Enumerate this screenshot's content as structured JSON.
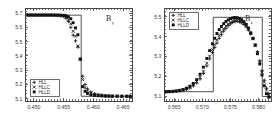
{
  "figure": {
    "background": "#ffffff",
    "frame_color": "#4a4a4a",
    "marker_color": "#111111",
    "panel_count": 2
  },
  "chart_data": [
    {
      "type": "scatter",
      "panel_id": "left",
      "title": "",
      "annotation": "B",
      "annotation_sub": "y",
      "xlabel": "",
      "ylabel": "",
      "xlim": [
        0.4485,
        0.4665
      ],
      "ylim": [
        5.085,
        5.735
      ],
      "xticks": [
        0.45,
        0.455,
        0.46,
        0.465
      ],
      "xtick_labels": [
        "0.450",
        "0.455",
        "0.460",
        "0.465"
      ],
      "yticks": [
        5.1,
        5.2,
        5.3,
        5.4,
        5.5,
        5.6,
        5.7
      ],
      "ytick_labels": [
        "5.1",
        "5.2",
        "5.3",
        "5.4",
        "5.5",
        "5.6",
        "5.7"
      ],
      "grid": false,
      "legend_position": "lower-left",
      "reference_step": {
        "name": "exact",
        "x": [
          0.4485,
          0.45795,
          0.45795,
          0.4665
        ],
        "y": [
          5.685,
          5.685,
          5.118,
          5.118
        ]
      },
      "series": [
        {
          "name": "HLL",
          "marker": "plus",
          "x": [
            0.449,
            0.4495,
            0.45,
            0.4505,
            0.451,
            0.4515,
            0.452,
            0.4525,
            0.453,
            0.4535,
            0.454,
            0.4545,
            0.455,
            0.4554,
            0.4558,
            0.4562,
            0.4566,
            0.457,
            0.4574,
            0.4578,
            0.4582,
            0.4586,
            0.459,
            0.4596,
            0.4602,
            0.4608,
            0.4614,
            0.462,
            0.4626,
            0.4632,
            0.464,
            0.4648,
            0.4656,
            0.4662
          ],
          "y": [
            5.684,
            5.684,
            5.684,
            5.684,
            5.684,
            5.684,
            5.684,
            5.684,
            5.684,
            5.683,
            5.682,
            5.681,
            5.676,
            5.664,
            5.64,
            5.6,
            5.545,
            5.505,
            5.462,
            5.376,
            5.258,
            5.2,
            5.17,
            5.148,
            5.136,
            5.13,
            5.126,
            5.123,
            5.121,
            5.12,
            5.119,
            5.118,
            5.118,
            5.118
          ]
        },
        {
          "name": "HLLC",
          "marker": "cross",
          "x": [
            0.449,
            0.4495,
            0.45,
            0.4505,
            0.451,
            0.4515,
            0.452,
            0.4525,
            0.453,
            0.4535,
            0.454,
            0.4545,
            0.455,
            0.4554,
            0.4558,
            0.4562,
            0.4566,
            0.457,
            0.4574,
            0.4578,
            0.4582,
            0.4586,
            0.459,
            0.4596,
            0.4602,
            0.4608,
            0.4614,
            0.462,
            0.4626,
            0.4632,
            0.464,
            0.4648,
            0.4656,
            0.4662
          ],
          "y": [
            5.685,
            5.685,
            5.685,
            5.685,
            5.685,
            5.685,
            5.685,
            5.685,
            5.685,
            5.684,
            5.684,
            5.683,
            5.68,
            5.672,
            5.656,
            5.625,
            5.572,
            5.538,
            5.47,
            5.378,
            5.235,
            5.178,
            5.155,
            5.14,
            5.131,
            5.127,
            5.124,
            5.122,
            5.12,
            5.119,
            5.119,
            5.118,
            5.118,
            5.118
          ]
        },
        {
          "name": "HLLD",
          "marker": "square",
          "x": [
            0.449,
            0.4495,
            0.45,
            0.4505,
            0.451,
            0.4515,
            0.452,
            0.4525,
            0.453,
            0.4535,
            0.454,
            0.4545,
            0.455,
            0.4554,
            0.4558,
            0.4562,
            0.4566,
            0.457,
            0.4574,
            0.4578,
            0.4582,
            0.4586,
            0.459,
            0.4596,
            0.4602,
            0.4608,
            0.4614,
            0.462,
            0.4626,
            0.4632,
            0.464,
            0.4648,
            0.4656,
            0.4662
          ],
          "y": [
            5.686,
            5.686,
            5.686,
            5.686,
            5.686,
            5.686,
            5.686,
            5.686,
            5.686,
            5.686,
            5.686,
            5.685,
            5.684,
            5.681,
            5.674,
            5.66,
            5.632,
            5.596,
            5.548,
            5.378,
            5.186,
            5.152,
            5.138,
            5.128,
            5.124,
            5.122,
            5.12,
            5.119,
            5.119,
            5.118,
            5.118,
            5.118,
            5.118,
            5.118
          ]
        }
      ]
    },
    {
      "type": "scatter",
      "panel_id": "right",
      "title": "",
      "annotation": "B",
      "annotation_sub": "z",
      "xlabel": "",
      "ylabel": "",
      "xlim": [
        0.5632,
        0.5822
      ],
      "ylim": [
        5.075,
        5.545
      ],
      "xticks": [
        0.565,
        0.57,
        0.575,
        0.58
      ],
      "xtick_labels": [
        "0.565",
        "0.570",
        "0.575",
        "0.580"
      ],
      "yticks": [
        5.1,
        5.2,
        5.3,
        5.4,
        5.5
      ],
      "ytick_labels": [
        "5.1",
        "5.2",
        "5.3",
        "5.4",
        "5.5"
      ],
      "grid": false,
      "legend_position": "upper-left",
      "reference_step": {
        "name": "exact",
        "x": [
          0.5632,
          0.57195,
          0.57195,
          0.58065,
          0.58065,
          0.5822
        ],
        "y": [
          5.122,
          5.122,
          5.498,
          5.498,
          5.098,
          5.098
        ]
      },
      "series": [
        {
          "name": "HLL",
          "marker": "plus",
          "x": [
            0.5636,
            0.5642,
            0.5648,
            0.5654,
            0.566,
            0.5666,
            0.5672,
            0.5678,
            0.5684,
            0.569,
            0.5696,
            0.5702,
            0.5708,
            0.5713,
            0.5718,
            0.5722,
            0.5726,
            0.573,
            0.5734,
            0.5738,
            0.5742,
            0.5746,
            0.575,
            0.5754,
            0.5758,
            0.5762,
            0.5766,
            0.577,
            0.5774,
            0.5778,
            0.5782,
            0.5786,
            0.579,
            0.5794,
            0.5798,
            0.5802,
            0.5806,
            0.581,
            0.5814,
            0.5818
          ],
          "y": [
            5.122,
            5.122,
            5.123,
            5.124,
            5.126,
            5.129,
            5.134,
            5.141,
            5.151,
            5.166,
            5.186,
            5.214,
            5.252,
            5.288,
            5.32,
            5.345,
            5.368,
            5.392,
            5.41,
            5.428,
            5.442,
            5.455,
            5.464,
            5.472,
            5.476,
            5.477,
            5.475,
            5.47,
            5.462,
            5.45,
            5.434,
            5.414,
            5.39,
            5.36,
            5.324,
            5.278,
            5.228,
            5.18,
            5.14,
            5.112
          ]
        },
        {
          "name": "HLLC",
          "marker": "cross",
          "x": [
            0.5636,
            0.5642,
            0.5648,
            0.5654,
            0.566,
            0.5666,
            0.5672,
            0.5678,
            0.5684,
            0.569,
            0.5696,
            0.5702,
            0.5708,
            0.5713,
            0.5718,
            0.5722,
            0.5726,
            0.573,
            0.5734,
            0.5738,
            0.5742,
            0.5746,
            0.575,
            0.5754,
            0.5758,
            0.5762,
            0.5766,
            0.577,
            0.5774,
            0.5778,
            0.5782,
            0.5786,
            0.579,
            0.5794,
            0.5798,
            0.5802,
            0.5806,
            0.581,
            0.5814,
            0.5818
          ],
          "y": [
            5.122,
            5.122,
            5.123,
            5.125,
            5.127,
            5.131,
            5.137,
            5.145,
            5.157,
            5.173,
            5.195,
            5.226,
            5.266,
            5.302,
            5.335,
            5.36,
            5.384,
            5.406,
            5.424,
            5.44,
            5.454,
            5.464,
            5.473,
            5.479,
            5.483,
            5.483,
            5.481,
            5.475,
            5.466,
            5.454,
            5.437,
            5.416,
            5.39,
            5.358,
            5.32,
            5.272,
            5.22,
            5.17,
            5.13,
            5.105
          ]
        },
        {
          "name": "HLLD",
          "marker": "square",
          "x": [
            0.5636,
            0.5642,
            0.5648,
            0.5654,
            0.566,
            0.5666,
            0.5672,
            0.5678,
            0.5684,
            0.569,
            0.5696,
            0.5702,
            0.5708,
            0.5713,
            0.5718,
            0.5722,
            0.5726,
            0.573,
            0.5734,
            0.5738,
            0.5742,
            0.5746,
            0.575,
            0.5754,
            0.5758,
            0.5762,
            0.5766,
            0.577,
            0.5774,
            0.5778,
            0.5782,
            0.5786,
            0.579,
            0.5794,
            0.5798,
            0.5802,
            0.5806,
            0.581,
            0.5814,
            0.5818
          ],
          "y": [
            5.122,
            5.123,
            5.124,
            5.126,
            5.129,
            5.133,
            5.14,
            5.15,
            5.164,
            5.183,
            5.21,
            5.246,
            5.29,
            5.33,
            5.364,
            5.392,
            5.416,
            5.436,
            5.452,
            5.466,
            5.477,
            5.485,
            5.491,
            5.495,
            5.497,
            5.496,
            5.492,
            5.486,
            5.476,
            5.462,
            5.444,
            5.42,
            5.392,
            5.356,
            5.314,
            5.262,
            5.206,
            5.152,
            5.112,
            5.094
          ]
        }
      ]
    }
  ],
  "legend": {
    "entries": [
      {
        "label": "HLL",
        "marker": "plus"
      },
      {
        "label": "HLLC",
        "marker": "cross"
      },
      {
        "label": "HLLD",
        "marker": "square"
      }
    ]
  }
}
